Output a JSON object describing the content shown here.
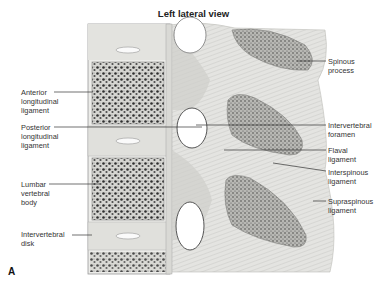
{
  "figure": {
    "title": "Left lateral view",
    "panel_letter": "A",
    "labels_left": [
      {
        "id": "anterior-longitudinal-ligament",
        "text": "Anterior\nlongitudinal\nligament"
      },
      {
        "id": "posterior-longitudinal-ligament",
        "text": "Posterior\nlongitudinal\nligament"
      },
      {
        "id": "lumbar-vertebral-body",
        "text": "Lumbar\nvertebral\nbody"
      },
      {
        "id": "intervertebral-disk",
        "text": "Intervertebral\ndisk"
      }
    ],
    "labels_right": [
      {
        "id": "spinous-process",
        "text": "Spinous\nprocess"
      },
      {
        "id": "intervertebral-foramen",
        "text": "Intervertebral\nforamen"
      },
      {
        "id": "flaval-ligament",
        "text": "Flaval\nligament"
      },
      {
        "id": "interspinous-ligament",
        "text": "Interspinous\nligament"
      },
      {
        "id": "supraspinous-ligament",
        "text": "Supraspinous\nligament"
      }
    ]
  },
  "colors": {
    "bone_outline": "#9a9a9a",
    "cortical": "#e6e6e3",
    "cancellous_fill": "#d8d8d4",
    "trabecular": "#3a3a3a",
    "ligament": "#c9c9c6",
    "spinous_fill": "#b9b9b6",
    "leader": "#333333"
  }
}
